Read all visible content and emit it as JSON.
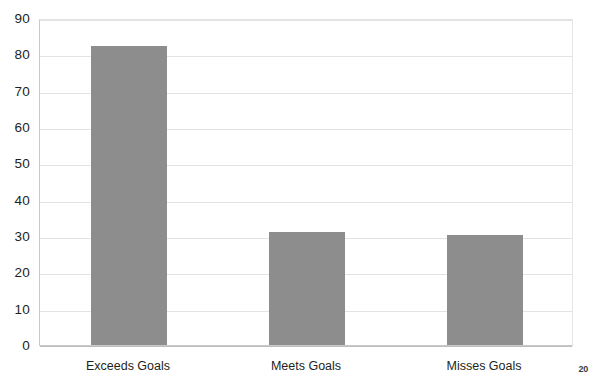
{
  "page": {
    "page_number": "20",
    "background_color": "#ffffff"
  },
  "chart_data": {
    "type": "bar",
    "title": "",
    "subtitle": "",
    "xlabel": "",
    "ylabel": "",
    "categories": [
      "Exceeds Goals",
      "Meets Goals",
      "Misses Goals"
    ],
    "values": [
      82.5,
      31.5,
      30.5
    ],
    "series": [
      {
        "name": "Performance Rating Distribution",
        "values": [
          82.5,
          31.5,
          30.5
        ]
      }
    ],
    "ylim": [
      0,
      90
    ],
    "ytick_step": 10,
    "yticks": [
      90,
      80,
      70,
      60,
      50,
      40,
      30,
      20,
      10,
      0
    ],
    "ytick_labels": [
      "90",
      "80",
      "70",
      "60",
      "50",
      "40",
      "30",
      "20",
      "10",
      "0"
    ],
    "grid": true,
    "grid_axis": "y",
    "legend": false,
    "legend_position": "none",
    "bar_color": "#8d8d8d",
    "grid_color": "#e3e3e3",
    "axis_color": "#c9c9c9",
    "annotations": []
  }
}
